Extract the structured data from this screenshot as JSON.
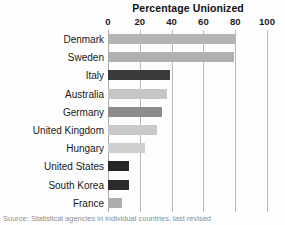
{
  "chart_data": {
    "type": "bar",
    "orientation": "horizontal",
    "title": "Percentage Unionized",
    "xlabel": "",
    "ylabel": "",
    "xlim": [
      0,
      100
    ],
    "xticks": [
      0,
      20,
      40,
      60,
      80,
      100
    ],
    "xtick_labels": [
      "0",
      "20",
      "40",
      "60",
      "80",
      "100"
    ],
    "grid": true,
    "legend": "none",
    "categories": [
      "Denmark",
      "Sweden",
      "Italy",
      "Australia",
      "Germany",
      "United Kingdom",
      "Hungary",
      "United States",
      "South Korea",
      "France"
    ],
    "values": [
      80,
      79,
      39,
      37,
      34,
      31,
      23,
      13,
      13,
      9
    ],
    "bar_colors": [
      "#b4b4b4",
      "#b0b0b0",
      "#3b3b3b",
      "#c6c6c6",
      "#8c8c8c",
      "#c9c9c9",
      "#cfcfcf",
      "#262626",
      "#2b2b2b",
      "#adadad"
    ]
  },
  "source": {
    "note": "Source: Statistical agencies in individual countries, last revised"
  },
  "style": {
    "gridline_color": "#b9b9b9",
    "background": "#fdfdfd",
    "text_color": "#1a1a1a"
  }
}
